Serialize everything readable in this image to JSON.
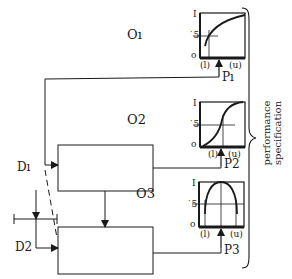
{
  "outputs": [
    {
      "label": "Oı",
      "param": "Pı",
      "curve": "concave-increasing"
    },
    {
      "label": "O2",
      "param": "P2",
      "curve": "sigmoid"
    },
    {
      "label": "O3",
      "param": "P3",
      "curve": "inverted-U"
    }
  ],
  "axis": {
    "top": "I",
    "mid": "˙5",
    "bottom": "o",
    "lower": "(l)",
    "upper": "(u)"
  },
  "disturbances": {
    "d1": "Dı",
    "d2": "D2"
  },
  "brace_label_line1": "performance",
  "brace_label_line2": "specification",
  "colors": {
    "ink": "#1a1a1a",
    "background": "#ffffff"
  }
}
